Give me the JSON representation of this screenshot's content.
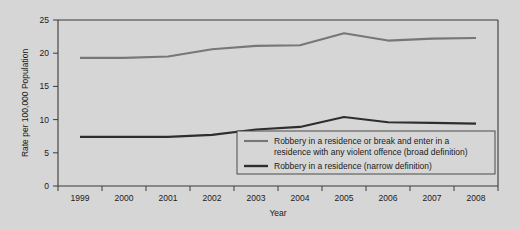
{
  "chart_data": {
    "type": "line",
    "title": "",
    "xlabel": "Year",
    "ylabel": "Rate per 100,000 Population",
    "categories": [
      "1999",
      "2000",
      "2001",
      "2002",
      "2003",
      "2004",
      "2005",
      "2006",
      "2007",
      "2008"
    ],
    "x": [
      1999,
      2000,
      2001,
      2002,
      2003,
      2004,
      2005,
      2006,
      2007,
      2008
    ],
    "xlim": [
      1999,
      2008
    ],
    "ylim": [
      0,
      25
    ],
    "yticks": [
      0,
      5,
      10,
      15,
      20,
      25
    ],
    "ytick_labels": [
      "0",
      "5",
      "10",
      "15",
      "20",
      "25"
    ],
    "grid": false,
    "legend_position": "inside-lower-right",
    "series": [
      {
        "name": "Robbery in a residence or break and enter in a residence with any violent offence (broad definition)",
        "color": "#777777",
        "values": [
          19.3,
          19.3,
          19.5,
          20.6,
          21.1,
          21.2,
          23.0,
          21.9,
          22.2,
          22.3
        ]
      },
      {
        "name": "Robbery in a residence (narrow definition)",
        "color": "#2e2e2e",
        "values": [
          7.4,
          7.4,
          7.4,
          7.7,
          8.5,
          8.9,
          10.4,
          9.6,
          9.5,
          9.4
        ]
      }
    ]
  },
  "axes": {
    "y_axis_title": "Rate per 100,000 Population",
    "x_axis_title": "Year",
    "y_tick_0": "0",
    "y_tick_1": "5",
    "y_tick_2": "10",
    "y_tick_3": "15",
    "y_tick_4": "20",
    "y_tick_5": "25",
    "x_tick_0": "1999",
    "x_tick_1": "2000",
    "x_tick_2": "2001",
    "x_tick_3": "2002",
    "x_tick_4": "2003",
    "x_tick_5": "2004",
    "x_tick_6": "2005",
    "x_tick_7": "2006",
    "x_tick_8": "2007",
    "x_tick_9": "2008"
  },
  "legend": {
    "broad_line_1": "Robbery in a residence or break and enter in a",
    "broad_line_2": "residence with any violent offence (broad definition)",
    "narrow_line_1": "Robbery in a residence (narrow definition)"
  },
  "colors": {
    "background": "#d6d6d6",
    "axis": "#3b3b3b",
    "broad_series": "#777777",
    "narrow_series": "#2e2e2e",
    "text": "#1a1a1a"
  }
}
